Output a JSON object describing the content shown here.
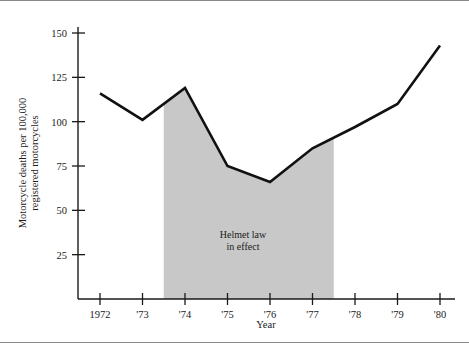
{
  "chart_data": {
    "type": "line",
    "title": "",
    "subtitle": "",
    "xlabel": "Year",
    "ylabel": "Motorcycle deaths per 100,000 registered motorcycles",
    "ylabel_line1": "Motorcycle deaths per 100,000",
    "ylabel_line2": "registered motorcycles",
    "x": [
      1972,
      1973,
      1974,
      1975,
      1976,
      1977,
      1978,
      1979,
      1980
    ],
    "categories": [
      "1972",
      "'73",
      "'74",
      "'75",
      "'76",
      "'77",
      "'78",
      "'79",
      "'80"
    ],
    "values": [
      116,
      101,
      119,
      75,
      66,
      85,
      97,
      110,
      143
    ],
    "series": [
      {
        "name": "Motorcycle deaths per 100,000 registered motorcycles",
        "values": [
          116,
          101,
          119,
          75,
          66,
          85,
          97,
          110,
          143
        ]
      }
    ],
    "ylim": [
      0,
      160
    ],
    "xlim": [
      1971.6,
      1980.4
    ],
    "yticks": [
      25,
      50,
      75,
      100,
      125,
      150
    ],
    "ytick_labels": [
      "25",
      "50",
      "75",
      "100",
      "125",
      "150"
    ],
    "xticks": [
      1972,
      1973,
      1974,
      1975,
      1976,
      1977,
      1978,
      1979,
      1980
    ],
    "xtick_labels": [
      "1972",
      "'73",
      "'74",
      "'75",
      "'76",
      "'77",
      "'78",
      "'79",
      "'80"
    ],
    "grid": false,
    "legend": false,
    "legend_position": "none",
    "line_color": "#111111",
    "shade_color": "#c8c8c8",
    "background_color": "#ffffff",
    "annotations": [
      {
        "name": "helmet-law-band",
        "text_line1": "Helmet law",
        "text_line2": "in effect",
        "text": "Helmet law in effect",
        "x_start": 1973.5,
        "x_end": 1977.5,
        "shaded": true
      }
    ]
  },
  "axes": {
    "y_title_line1": "Motorcycle deaths per 100,000",
    "y_title_line2": "registered motorcycles",
    "x_title": "Year"
  }
}
